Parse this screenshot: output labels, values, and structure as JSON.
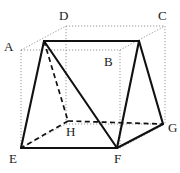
{
  "figure": {
    "kind": "geometry-diagram",
    "canvas": {
      "width": 180,
      "height": 173
    },
    "colors": {
      "background": "#ffffff",
      "solid_edge": "#111111",
      "hidden_edge": "#111111",
      "construction_line": "#8c8c8c",
      "label_text": "#1a1a1a"
    },
    "stroke_widths": {
      "solid_edge": 2.1,
      "hidden_edge": 1.7,
      "construction_line": 0.9
    },
    "labels": [
      {
        "id": "A",
        "text": "A",
        "x": 4,
        "y": 40
      },
      {
        "id": "B",
        "text": "B",
        "x": 104,
        "y": 55
      },
      {
        "id": "C",
        "text": "C",
        "x": 158,
        "y": 9
      },
      {
        "id": "D",
        "text": "D",
        "x": 59,
        "y": 9
      },
      {
        "id": "E",
        "text": "E",
        "x": 9,
        "y": 152
      },
      {
        "id": "F",
        "text": "F",
        "x": 114,
        "y": 152
      },
      {
        "id": "G",
        "text": "G",
        "x": 168,
        "y": 121
      },
      {
        "id": "H",
        "text": "H",
        "x": 66,
        "y": 125
      }
    ],
    "vertices": {
      "A": {
        "x": 21,
        "y": 50
      },
      "B": {
        "x": 120,
        "y": 50
      },
      "C": {
        "x": 165,
        "y": 26
      },
      "D": {
        "x": 66,
        "y": 26
      },
      "E": {
        "x": 21,
        "y": 148
      },
      "F": {
        "x": 120,
        "y": 148
      },
      "G": {
        "x": 165,
        "y": 124
      },
      "H": {
        "x": 66,
        "y": 124
      },
      "P": {
        "x": 44,
        "y": 41
      },
      "Q": {
        "x": 139,
        "y": 41
      },
      "E2": {
        "x": 21,
        "y": 148
      },
      "F2": {
        "x": 117,
        "y": 148
      },
      "G2": {
        "x": 163,
        "y": 124
      },
      "H2": {
        "x": 68,
        "y": 121
      }
    },
    "construction_edges": [
      {
        "name": "cube-edge-A-B",
        "from": "A",
        "to": "B"
      },
      {
        "name": "cube-edge-A-D",
        "from": "A",
        "to": "D"
      },
      {
        "name": "cube-edge-D-C",
        "from": "D",
        "to": "C"
      },
      {
        "name": "cube-edge-B-C",
        "from": "B",
        "to": "C"
      },
      {
        "name": "cube-edge-A-E",
        "from": "A",
        "to": "E"
      },
      {
        "name": "cube-edge-B-F",
        "from": "B",
        "to": "F"
      },
      {
        "name": "cube-edge-C-G",
        "from": "C",
        "to": "G"
      },
      {
        "name": "cube-edge-D-H",
        "from": "D",
        "to": "H"
      },
      {
        "name": "cube-edge-E-F",
        "from": "E",
        "to": "F"
      },
      {
        "name": "cube-edge-F-G",
        "from": "F",
        "to": "G"
      },
      {
        "name": "cube-edge-E-H",
        "from": "E",
        "to": "H"
      },
      {
        "name": "cube-edge-H-G",
        "from": "H",
        "to": "G"
      }
    ],
    "solid_edges": [
      {
        "name": "prism-top-edge",
        "from": "P",
        "to": "Q"
      },
      {
        "name": "prism-edge-P-E",
        "from": "P",
        "to": "E2"
      },
      {
        "name": "prism-edge-P-F",
        "from": "P",
        "to": "F2"
      },
      {
        "name": "prism-edge-Q-F",
        "from": "Q",
        "to": "F2"
      },
      {
        "name": "prism-edge-Q-G",
        "from": "Q",
        "to": "G2"
      },
      {
        "name": "prism-base-edge-E-F",
        "from": "E2",
        "to": "F2"
      },
      {
        "name": "prism-base-edge-F-G",
        "from": "F2",
        "to": "G2"
      }
    ],
    "hidden_edges": [
      {
        "name": "hidden-edge-P-H",
        "from": "P",
        "to": "H2"
      },
      {
        "name": "hidden-edge-H-E",
        "from": "H2",
        "to": "E2"
      },
      {
        "name": "hidden-edge-H-G",
        "from": "H2",
        "to": "G2"
      }
    ]
  }
}
